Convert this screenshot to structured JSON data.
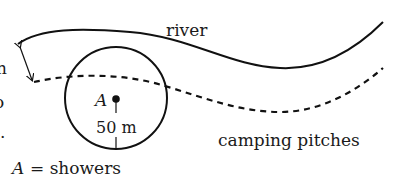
{
  "diagram": {
    "labels": {
      "river": "river",
      "camping": "camping pitches",
      "point": "A",
      "radius": "50 m",
      "legend_var": "A",
      "legend_eq": "= showers",
      "cut_left_1": "n",
      "cut_left_2": "o",
      "cut_left_3": "."
    },
    "circle": {
      "center_label": "A",
      "radius_label": "50 m"
    },
    "colors": {
      "stroke": "#111111",
      "background": "#ffffff"
    }
  }
}
